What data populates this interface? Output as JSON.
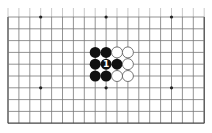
{
  "diagram": {
    "type": "go-board-fragment",
    "board_size": 19,
    "visible_columns": 19,
    "visible_rows": 10,
    "first_visible_row_line": 10,
    "top_cropped": true,
    "grid": {
      "x0": 8,
      "y0": 17,
      "dx": 10.9,
      "dy": 11.8,
      "line_color": "#777777",
      "edge_color": "#444444"
    },
    "star_points": [
      {
        "col": 3,
        "row": 0
      },
      {
        "col": 9,
        "row": 0
      },
      {
        "col": 15,
        "row": 0
      },
      {
        "col": 3,
        "row": 6
      },
      {
        "col": 9,
        "row": 6
      },
      {
        "col": 15,
        "row": 6
      }
    ],
    "stones": [
      {
        "col": 8,
        "row": 3,
        "color": "black"
      },
      {
        "col": 9,
        "row": 3,
        "color": "black"
      },
      {
        "col": 10,
        "row": 3,
        "color": "white"
      },
      {
        "col": 11,
        "row": 3,
        "color": "white"
      },
      {
        "col": 8,
        "row": 4,
        "color": "black"
      },
      {
        "col": 9,
        "row": 4,
        "color": "black",
        "label": "1"
      },
      {
        "col": 10,
        "row": 4,
        "color": "black"
      },
      {
        "col": 11,
        "row": 4,
        "color": "white"
      },
      {
        "col": 8,
        "row": 5,
        "color": "black"
      },
      {
        "col": 9,
        "row": 5,
        "color": "black"
      },
      {
        "col": 10,
        "row": 5,
        "color": "white"
      },
      {
        "col": 11,
        "row": 5,
        "color": "white"
      }
    ],
    "colors": {
      "black_stone": "#111111",
      "white_stone": "#ffffff",
      "white_stone_outline": "#555555",
      "label_on_black": "#ffffff"
    }
  }
}
